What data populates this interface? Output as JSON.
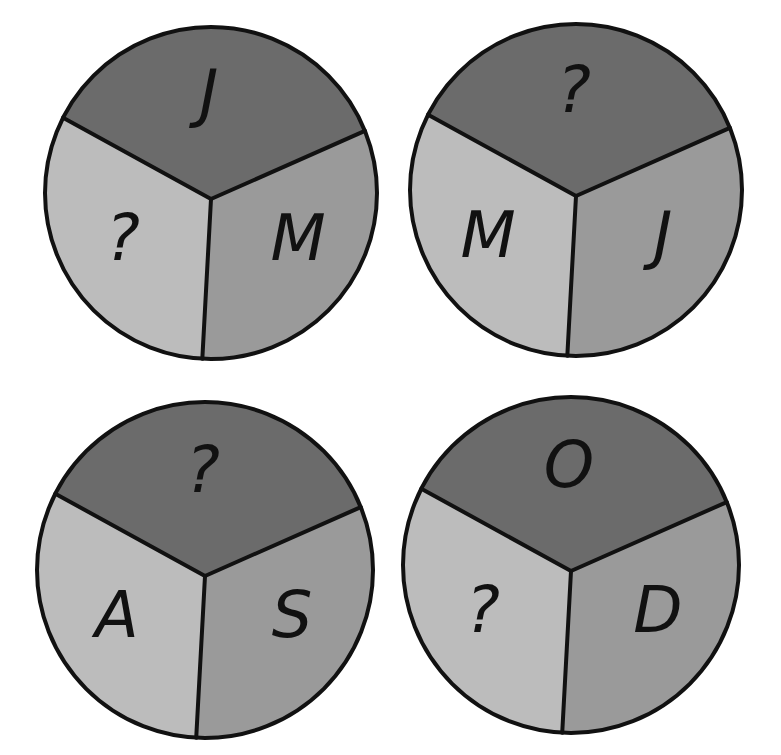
{
  "puzzle": {
    "colors": {
      "top": "#6b6b6b",
      "left": "#bcbcbc",
      "right": "#9a9a9a",
      "stroke": "#111111",
      "background": "#ffffff"
    },
    "circles": [
      {
        "name": "circle-top-left",
        "top": "J",
        "left": "?",
        "right": "M"
      },
      {
        "name": "circle-top-right",
        "top": "?",
        "left": "M",
        "right": "J"
      },
      {
        "name": "circle-bottom-left",
        "top": "?",
        "left": "A",
        "right": "S"
      },
      {
        "name": "circle-bottom-right",
        "top": "O",
        "left": "?",
        "right": "D"
      }
    ]
  }
}
